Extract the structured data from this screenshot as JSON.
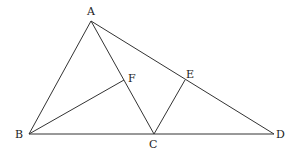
{
  "diagram": {
    "type": "geometry",
    "line_color": "#333333",
    "label_color": "#222222",
    "points": {
      "A": {
        "x": 91,
        "y": 21
      },
      "B": {
        "x": 29,
        "y": 134
      },
      "C": {
        "x": 154,
        "y": 134
      },
      "D": {
        "x": 274,
        "y": 134
      },
      "E": {
        "x": 185,
        "y": 80
      },
      "F": {
        "x": 124,
        "y": 80
      }
    },
    "segments": [
      [
        "A",
        "B"
      ],
      [
        "A",
        "C"
      ],
      [
        "A",
        "D"
      ],
      [
        "B",
        "D"
      ],
      [
        "B",
        "F"
      ],
      [
        "C",
        "E"
      ]
    ],
    "labels": {
      "A": "A",
      "B": "B",
      "C": "C",
      "D": "D",
      "E": "E",
      "F": "F"
    }
  }
}
